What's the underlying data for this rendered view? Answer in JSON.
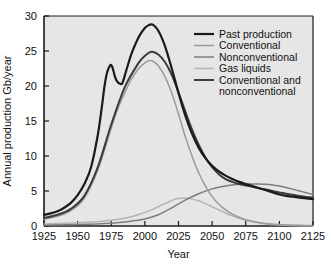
{
  "chart_data": {
    "type": "line",
    "title": "",
    "xlabel": "Year",
    "ylabel": "Annual production Gb/year",
    "xlim": [
      1925,
      2125
    ],
    "ylim": [
      0,
      30
    ],
    "xticks": [
      1925,
      1950,
      1975,
      2000,
      2025,
      2050,
      2075,
      2100,
      2125
    ],
    "yticks": [
      0,
      5,
      10,
      15,
      20,
      25,
      30
    ],
    "grid": false,
    "legend_position": "top-right",
    "colors": {
      "past_production": "#1a1a1a",
      "conventional": "#9a9a9a",
      "nonconventional": "#7d7d7d",
      "gas_liquids": "#b4b4b4",
      "conventional_and_nonconventional": "#3c3c3c",
      "plot_background": "#e6e6e6",
      "axis": "#1a1a1a",
      "page_background": "#ffffff"
    },
    "series": [
      {
        "name": "Past production",
        "color": "#1a1a1a",
        "x": [
          1925,
          1930,
          1935,
          1940,
          1945,
          1950,
          1955,
          1960,
          1965,
          1968,
          1970,
          1972,
          1974,
          1975,
          1976,
          1978,
          1980,
          1982,
          1983,
          1984,
          1986,
          1988,
          1990,
          1993,
          1996,
          2000,
          2003,
          2005,
          2007,
          2010,
          2013,
          2016,
          2020,
          2025,
          2030,
          2035,
          2040,
          2045,
          2050,
          2055,
          2060,
          2065,
          2070,
          2075,
          2080,
          2085,
          2090,
          2095,
          2100,
          2105,
          2110,
          2115,
          2120,
          2125
        ],
        "y": [
          1.6,
          1.8,
          2.1,
          2.6,
          3.3,
          4.4,
          6.0,
          8.4,
          13.0,
          17.0,
          20.0,
          22.0,
          22.9,
          23.0,
          22.6,
          21.2,
          20.5,
          20.3,
          20.3,
          20.8,
          22.1,
          23.4,
          24.6,
          26.0,
          27.2,
          28.3,
          28.7,
          28.8,
          28.6,
          27.9,
          26.7,
          25.1,
          22.5,
          19.0,
          15.8,
          13.2,
          11.2,
          9.7,
          8.6,
          7.8,
          7.2,
          6.7,
          6.3,
          6.0,
          5.7,
          5.4,
          5.1,
          4.8,
          4.5,
          4.3,
          4.2,
          4.05,
          3.95,
          3.85
        ]
      },
      {
        "name": "Conventional",
        "color": "#9a9a9a",
        "x": [
          1925,
          1935,
          1945,
          1955,
          1965,
          1975,
          1980,
          1985,
          1990,
          1995,
          2000,
          2003,
          2005,
          2007,
          2010,
          2015,
          2020,
          2025,
          2030,
          2035,
          2040,
          2045,
          2050,
          2055,
          2060,
          2065,
          2070,
          2075,
          2080,
          2085,
          2090,
          2095,
          2100,
          2105,
          2110,
          2115,
          2120,
          2125
        ],
        "y": [
          1.0,
          1.4,
          2.2,
          4.0,
          8.0,
          14.0,
          16.8,
          19.0,
          21.0,
          22.4,
          23.3,
          23.6,
          23.6,
          23.4,
          22.9,
          21.3,
          19.0,
          16.0,
          12.8,
          10.0,
          7.6,
          5.7,
          4.2,
          3.1,
          2.3,
          1.7,
          1.25,
          0.9,
          0.68,
          0.5,
          0.37,
          0.28,
          0.2,
          0.15,
          0.12,
          0.09,
          0.07,
          0.05
        ]
      },
      {
        "name": "Nonconventional",
        "color": "#7d7d7d",
        "x": [
          1925,
          1950,
          1975,
          1990,
          2000,
          2010,
          2020,
          2030,
          2040,
          2050,
          2060,
          2070,
          2075,
          2080,
          2085,
          2090,
          2095,
          2100,
          2105,
          2110,
          2115,
          2120,
          2125
        ],
        "y": [
          0.12,
          0.2,
          0.4,
          0.7,
          1.0,
          1.6,
          2.6,
          3.7,
          4.6,
          5.3,
          5.7,
          5.95,
          6.0,
          6.0,
          6.0,
          5.95,
          5.85,
          5.7,
          5.5,
          5.25,
          5.0,
          4.75,
          4.5
        ]
      },
      {
        "name": "Gas liquids",
        "color": "#b4b4b4",
        "x": [
          1925,
          1950,
          1970,
          1985,
          1995,
          2005,
          2015,
          2022,
          2028,
          2032,
          2036,
          2040,
          2045,
          2050,
          2055,
          2060,
          2065,
          2070,
          2075,
          2080,
          2085,
          2090,
          2095,
          2100,
          2110,
          2125
        ],
        "y": [
          0.3,
          0.45,
          0.7,
          1.1,
          1.6,
          2.3,
          3.2,
          3.8,
          4.0,
          3.95,
          3.8,
          3.6,
          3.2,
          2.75,
          2.3,
          1.85,
          1.45,
          1.1,
          0.82,
          0.6,
          0.43,
          0.3,
          0.2,
          0.14,
          0.07,
          0.03
        ]
      },
      {
        "name": "Conventional and nonconventional",
        "color": "#3c3c3c",
        "x": [
          1925,
          1935,
          1945,
          1955,
          1965,
          1975,
          1985,
          1995,
          2000,
          2005,
          2010,
          2015,
          2020,
          2025,
          2030,
          2035,
          2040,
          2045,
          2050,
          2055,
          2060,
          2065,
          2070,
          2075,
          2080,
          2085,
          2090,
          2095,
          2100,
          2105,
          2110,
          2115,
          2120,
          2125
        ],
        "y": [
          1.15,
          1.6,
          2.45,
          4.3,
          8.4,
          14.5,
          19.8,
          23.2,
          24.3,
          24.9,
          24.5,
          23.4,
          21.6,
          19.1,
          16.4,
          13.8,
          11.6,
          9.8,
          8.4,
          7.4,
          6.7,
          6.3,
          6.0,
          5.8,
          5.6,
          5.4,
          5.2,
          5.0,
          4.8,
          4.6,
          4.45,
          4.3,
          4.15,
          4.05
        ]
      }
    ]
  },
  "axes": {
    "ylabel": "Annual production Gb/year",
    "xlabel": "Year",
    "xtick_labels": [
      "1925",
      "1950",
      "1975",
      "2000",
      "2025",
      "2050",
      "2075",
      "2100",
      "2125"
    ],
    "ytick_labels": [
      "0",
      "5",
      "10",
      "15",
      "20",
      "25",
      "30"
    ]
  },
  "legend": {
    "items": [
      {
        "label": "Past production",
        "color": "#1a1a1a",
        "width": 2.2
      },
      {
        "label": "Conventional",
        "color": "#9a9a9a",
        "width": 1.5
      },
      {
        "label": "Nonconventional",
        "color": "#7d7d7d",
        "width": 1.5
      },
      {
        "label": "Gas liquids",
        "color": "#b4b4b4",
        "width": 1.5
      },
      {
        "label": "Conventional and",
        "label2": "nonconventional",
        "color": "#3c3c3c",
        "width": 2.0
      }
    ]
  }
}
